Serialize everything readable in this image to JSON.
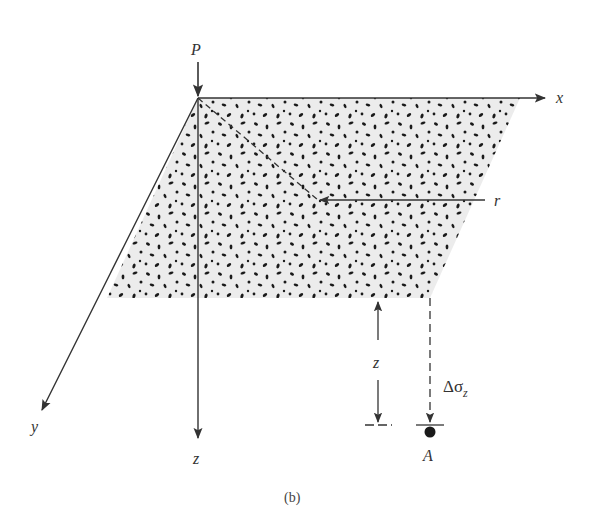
{
  "figure": {
    "caption": "(b)"
  },
  "labels": {
    "load_point": "P",
    "x_axis": "x",
    "y_axis": "y",
    "z_axis": "z",
    "radial_distance": "r",
    "depth": "z",
    "stress_increase_delta": "Δσ",
    "stress_increase_subscript": "z",
    "point": "A"
  },
  "colors": {
    "line": "#333333",
    "fill": "#ececec",
    "dots": "#1a1a1a"
  }
}
